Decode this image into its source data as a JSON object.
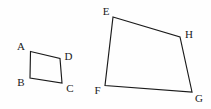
{
  "figure": {
    "type": "geometry-diagram",
    "background_color": "#fefefe",
    "stroke_color": "#1a1a1a",
    "label_color": "#1a1a1a",
    "canvas": {
      "width": 211,
      "height": 109
    }
  },
  "shapes": [
    {
      "id": "quadrilateral-abcd",
      "name": "ABCD",
      "vertex_order": "A,D,C,B",
      "points": "30.5,51.5 60,58.5 62,83 30,78",
      "vertices": [
        {
          "key": "A",
          "label": "A",
          "x": 30.5,
          "y": 51.5,
          "label_x": 21,
          "label_y": 47
        },
        {
          "key": "D",
          "label": "D",
          "x": 60,
          "y": 58.5,
          "label_x": 68.5,
          "label_y": 57
        },
        {
          "key": "C",
          "label": "C",
          "x": 62,
          "y": 83,
          "label_x": 70,
          "label_y": 89
        },
        {
          "key": "B",
          "label": "B",
          "x": 30,
          "y": 78,
          "label_x": 21,
          "label_y": 83
        }
      ]
    },
    {
      "id": "quadrilateral-efgh",
      "name": "EFGH",
      "vertex_order": "E,H,G,F",
      "points": "113,17 180,37 192,92 105,85.5",
      "vertices": [
        {
          "key": "E",
          "label": "E",
          "x": 113,
          "y": 17,
          "label_x": 106,
          "label_y": 12
        },
        {
          "key": "H",
          "label": "H",
          "x": 180,
          "y": 37,
          "label_x": 189,
          "label_y": 35
        },
        {
          "key": "G",
          "label": "G",
          "x": 192,
          "y": 92,
          "label_x": 199,
          "label_y": 99
        },
        {
          "key": "F",
          "label": "F",
          "x": 105,
          "y": 85.5,
          "label_x": 97.5,
          "label_y": 91
        }
      ]
    }
  ]
}
